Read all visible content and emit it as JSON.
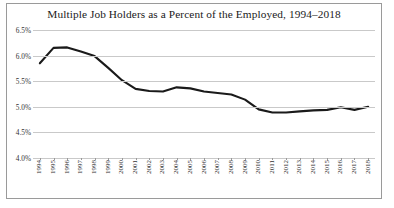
{
  "chart_data": {
    "type": "line",
    "title": "Multiple Job Holders as a Percent of the Employed, 1994–2018",
    "xlabel": "",
    "ylabel": "",
    "ylim": [
      4.0,
      6.5
    ],
    "ytick_labels": [
      "6.5%",
      "6.0%",
      "5.5%",
      "5.0%",
      "4.5%",
      "4.0%"
    ],
    "ytick_values": [
      6.5,
      6.0,
      5.5,
      5.0,
      4.5,
      4.0
    ],
    "grid": true,
    "legend": "none",
    "line_color": "#1a1a1a",
    "categories": [
      "1994",
      "1995",
      "1996",
      "1997",
      "1998",
      "1999",
      "2000",
      "2001",
      "2002",
      "2003",
      "2004",
      "2005",
      "2006",
      "2007",
      "2008",
      "2009",
      "2010",
      "2011",
      "2012",
      "2013",
      "2014",
      "2015",
      "2016",
      "2017",
      "2018"
    ],
    "series": [
      {
        "name": "Multiple job holders as percent of employed",
        "values": [
          5.85,
          6.15,
          6.16,
          6.08,
          5.99,
          5.76,
          5.52,
          5.35,
          5.31,
          5.3,
          5.38,
          5.36,
          5.3,
          5.27,
          5.24,
          5.14,
          4.95,
          4.89,
          4.89,
          4.91,
          4.93,
          4.94,
          4.99,
          4.94,
          5.0
        ]
      }
    ]
  },
  "axis": {
    "y_ticks": [
      {
        "label": "6.5%",
        "value": 6.5
      },
      {
        "label": "6.0%",
        "value": 6.0
      },
      {
        "label": "5.5%",
        "value": 5.5
      },
      {
        "label": "5.0%",
        "value": 5.0
      },
      {
        "label": "4.5%",
        "value": 4.5
      },
      {
        "label": "4.0%",
        "value": 4.0
      }
    ]
  }
}
